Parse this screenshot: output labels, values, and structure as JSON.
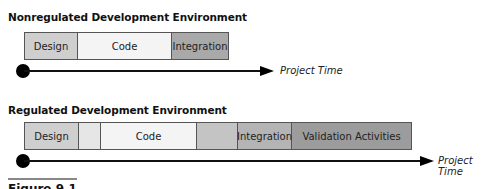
{
  "diagrams": [
    {
      "title": "Nonregulated Development Environment",
      "segments": [
        {
          "label": "Design",
          "color": "#cfcfcf"
        },
        {
          "label": "Code",
          "color": "#f4f4f4"
        },
        {
          "label": "Integration",
          "color": "#a9a9a9"
        }
      ],
      "axis_label": "Project Time"
    },
    {
      "title": "Regulated Development Environment",
      "segments": [
        {
          "label": "Design",
          "color": "#cfcfcf"
        },
        {
          "label": "",
          "color": "#e6e6e6"
        },
        {
          "label": "Code",
          "color": "#f4f4f4"
        },
        {
          "label": "",
          "color": "#c4c4c4"
        },
        {
          "label": "Integration",
          "color": "#b4b4b4"
        },
        {
          "label": "Validation Activities",
          "color": "#9c9c9c"
        }
      ],
      "axis_label": "Project Time"
    }
  ],
  "caption": "Figure 9.1"
}
